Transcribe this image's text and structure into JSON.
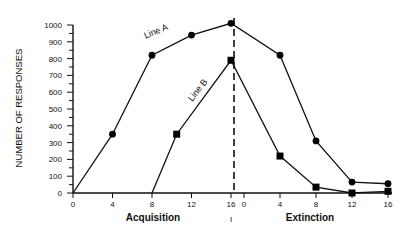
{
  "chart_data": {
    "type": "line",
    "title": "",
    "ylabel": "NUMBER OF RESPONSES",
    "xlabel_phases": [
      {
        "name": "Acquisition",
        "x_ticks": [
          0,
          4,
          8,
          12,
          16
        ]
      },
      {
        "name": "Extinction",
        "x_ticks": [
          0,
          4,
          8,
          12,
          16
        ]
      }
    ],
    "ylim": [
      0,
      1000
    ],
    "y_ticks": [
      0,
      100,
      200,
      300,
      400,
      500,
      600,
      700,
      800,
      900,
      1000
    ],
    "grid": false,
    "legend": "inline labels",
    "phase_divider": {
      "style": "dashed",
      "position": "end of acquisition session 16"
    },
    "series": [
      {
        "name": "Line A",
        "marker": "circle",
        "acquisition": {
          "x": [
            0,
            4,
            8,
            12,
            16
          ],
          "y": [
            0,
            350,
            820,
            940,
            1010
          ]
        },
        "extinction": {
          "x": [
            4,
            8,
            12,
            16
          ],
          "y": [
            820,
            310,
            65,
            55
          ]
        }
      },
      {
        "name": "Line B",
        "marker": "square",
        "acquisition": {
          "x": [
            8,
            10.5,
            16
          ],
          "y": [
            0,
            350,
            790
          ]
        },
        "extinction": {
          "x": [
            4,
            8,
            12,
            16
          ],
          "y": [
            220,
            35,
            0,
            10
          ]
        }
      }
    ]
  },
  "labels": {
    "y_title": "NUMBER OF RESPONSES",
    "acquisition": "Acquisition",
    "extinction": "Extinction",
    "line_a": "Line A",
    "line_b": "Line B",
    "divider_mark": "I"
  }
}
